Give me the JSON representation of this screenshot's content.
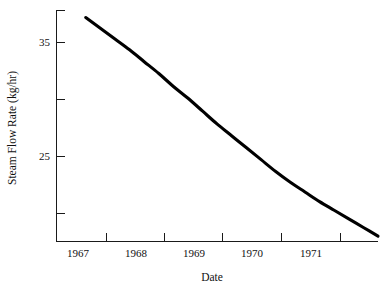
{
  "figure": {
    "background_color": "#ffffff",
    "width": 390,
    "height": 289
  },
  "axes": {
    "x_axis_title": "Date",
    "y_axis_title": "Steam Flow Rate (kg/hr)",
    "x_tick_labels": [
      "1967",
      "1968",
      "1969",
      "1970",
      "1971"
    ],
    "y_tick_labels": [
      "35",
      "25"
    ],
    "curve_color": "#000000",
    "axis_color": "#1a1a1a"
  },
  "chart_data": {
    "type": "line",
    "title": "",
    "subtitle": "",
    "xlabel": "Date",
    "ylabel": "Steam Flow Rate (kg/hr)",
    "grid": false,
    "legend": false,
    "xlim": [
      1966.5,
      1972.0
    ],
    "ylim": [
      17.0,
      38.5
    ],
    "x_tick_positions": [
      1967.0,
      1968.0,
      1969.0,
      1970.0,
      1971.0
    ],
    "x_tick_labels_positions": [
      1967.5,
      1968.5,
      1969.5,
      1970.5,
      1971.5
    ],
    "y_tick_positions": [
      37.5,
      35,
      30,
      25,
      20
    ],
    "y_labeled_ticks": [
      35,
      25
    ],
    "series": [
      {
        "name": "Steam Flow Rate",
        "x": [
          1967.0,
          1967.25,
          1967.5,
          1967.75,
          1968.0,
          1968.25,
          1968.5,
          1968.75,
          1969.0,
          1969.25,
          1969.5,
          1969.75,
          1970.0,
          1970.25,
          1970.5,
          1970.75,
          1971.0,
          1971.25,
          1971.5,
          1971.75,
          1972.0
        ],
        "values": [
          37.8,
          36.8,
          35.8,
          34.8,
          33.7,
          32.6,
          31.4,
          30.3,
          29.1,
          27.9,
          26.8,
          25.7,
          24.6,
          23.5,
          22.5,
          21.6,
          20.7,
          19.9,
          19.1,
          18.3,
          17.5
        ]
      }
    ]
  }
}
